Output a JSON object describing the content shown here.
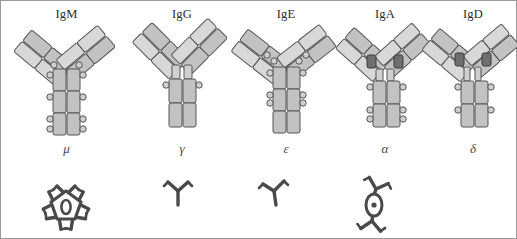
{
  "figure": {
    "background": "#ffffff",
    "border_color": "#9a9a9a",
    "domain_fill": "#c8c8c8",
    "domain_fill_light": "#dcdcdc",
    "domain_stroke": "#555555",
    "hinge_dark": "#6e6e6e",
    "polymer_color": "#4a4a4a",
    "label_color": "#2b2b2b"
  },
  "isotypes": [
    {
      "name": "IgM",
      "heavy_chain_symbol": "μ",
      "constant_domains": 4,
      "has_hinge": false,
      "polymer": "pentamer",
      "polymer_units": 5,
      "has_j_chain": true
    },
    {
      "name": "IgG",
      "heavy_chain_symbol": "γ",
      "constant_domains": 3,
      "has_hinge": true,
      "polymer": "monomer",
      "polymer_units": 1,
      "has_j_chain": false
    },
    {
      "name": "IgE",
      "heavy_chain_symbol": "ε",
      "constant_domains": 4,
      "has_hinge": false,
      "polymer": "monomer",
      "polymer_units": 1,
      "has_j_chain": false
    },
    {
      "name": "IgA",
      "heavy_chain_symbol": "α",
      "constant_domains": 3,
      "has_hinge": true,
      "polymer": "dimer",
      "polymer_units": 2,
      "has_j_chain": true
    },
    {
      "name": "IgD",
      "heavy_chain_symbol": "δ",
      "constant_domains": 3,
      "has_hinge": true,
      "polymer": "none",
      "polymer_units": 0,
      "has_j_chain": false
    }
  ]
}
